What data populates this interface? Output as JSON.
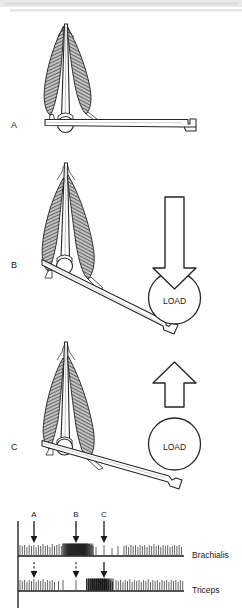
{
  "figure": {
    "title_bar": {
      "present": true,
      "color": "#e4e4e4"
    },
    "background": "#ffffff",
    "ink": "#1a1a1a",
    "muscle_fill": "#b9b9b9",
    "muscle_stripe": "#4a4a4a",
    "bone_fill": "#ffffff"
  },
  "panels": [
    {
      "id": "A",
      "label": "A",
      "state": "rest",
      "load_shown": false,
      "arrow_direction": "none",
      "load_label": ""
    },
    {
      "id": "B",
      "label": "B",
      "state": "lowering",
      "load_shown": true,
      "arrow_direction": "down",
      "load_label": "LOAD"
    },
    {
      "id": "C",
      "label": "C",
      "state": "lifting",
      "load_shown": true,
      "arrow_direction": "up",
      "load_label": "LOAD"
    }
  ],
  "emg": {
    "markers": [
      {
        "label": "A",
        "x_pct": 12.5
      },
      {
        "label": "B",
        "x_pct": 40.0
      },
      {
        "label": "C",
        "x_pct": 57.5
      }
    ],
    "traces": [
      {
        "name": "Brachialis",
        "label": "Brachialis",
        "burst_start_pct": 25,
        "burst_end_pct": 50,
        "burst_level": "high",
        "arrow_style": "solid"
      },
      {
        "name": "Triceps",
        "label": "Triceps",
        "burst_start_pct": 52,
        "burst_end_pct": 72,
        "burst_level": "high",
        "arrow_style": "dashed"
      }
    ],
    "axis": {
      "y_axis_visible": true,
      "baseline_visible": true
    }
  }
}
